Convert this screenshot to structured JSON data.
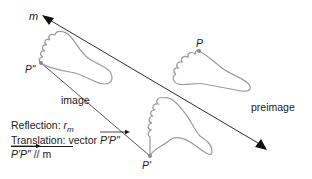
{
  "diagram": {
    "type": "glide-reflection",
    "line_label": "m",
    "points": {
      "P": "P",
      "P_prime": "P'",
      "P_double_prime": "P\""
    },
    "labels": {
      "image": "image",
      "preimage": "preimage"
    },
    "legend": {
      "reflection_prefix": "Reflection: ",
      "reflection_symbol": "r",
      "reflection_subscript": "m",
      "translation_prefix": "Translation: vector ",
      "translation_vector": "P'P\"",
      "parallel_vector": "P'P\"",
      "parallel_suffix": " // m"
    },
    "colors": {
      "line": "#2b2b2b",
      "foot_outline": "#9a9a9a",
      "point": "#8a8a8a",
      "text": "#1a1a1a"
    }
  }
}
